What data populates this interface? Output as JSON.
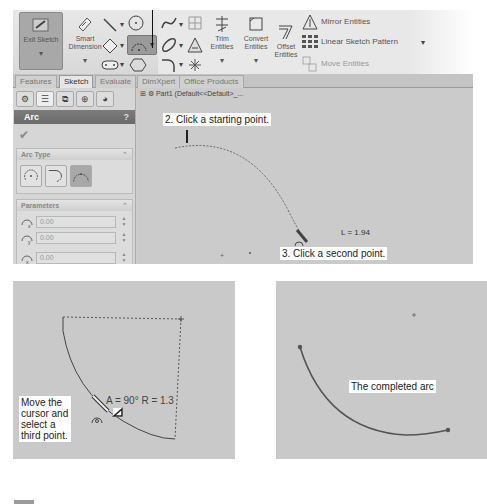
{
  "toolbar": {
    "exit_sketch": "Exit Sketch",
    "smart_dimension": "Smart Dimension",
    "trim_entities": "Trim Entities",
    "convert_entities": "Convert Entities",
    "offset_entities": "Offset Entities",
    "mirror_entities": "Mirror Entities",
    "linear_sketch_pattern": "Linear Sketch Pattern",
    "move_entities": "Move Entities",
    "dropdown_glyph": "▾"
  },
  "tabs": [
    "Features",
    "Sketch",
    "Evaluate",
    "DimXpert",
    "Office Products"
  ],
  "active_tab": "Sketch",
  "property_manager": {
    "title": "Arc",
    "help": "?",
    "ok_glyph": "✔",
    "arc_type_header": "Arc Type",
    "parameters_header": "Parameters",
    "collapse_glyph": "⌃",
    "parameters": [
      {
        "icon": "center-x-icon",
        "value": "0.00"
      },
      {
        "icon": "center-y-icon",
        "value": "0.00"
      },
      {
        "icon": "start-x-icon",
        "value": "0.00"
      }
    ]
  },
  "graphics": {
    "tree_label": "Part1  (Default<<Default>_...",
    "callout_start": "2. Click a starting point.",
    "callout_second": "3. Click a second point.",
    "length_label": "L = 1.94"
  },
  "step_third": {
    "callout": [
      "Move the",
      "cursor and",
      "select a",
      "third point."
    ],
    "dimension_label": "A = 90°  R = 1.3"
  },
  "completed": {
    "callout": "The completed arc"
  },
  "colors": {
    "arc_line": "#555555",
    "canvas_bg": "#cbcbcb",
    "panel_title_bg": "#737373",
    "callout_bg": "#ffffff"
  }
}
